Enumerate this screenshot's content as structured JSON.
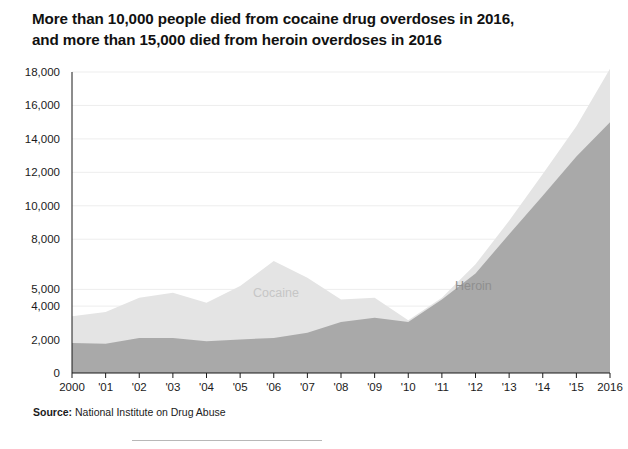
{
  "title": {
    "line1": "More than 10,000 people died from cocaine drug overdoses in 2016,",
    "line2": "and more than 15,000 died from heroin overdoses in 2016"
  },
  "source": {
    "label": "Source:",
    "text": " National Institute on Drug Abuse"
  },
  "colors": {
    "heroin_fill": "#a9a9a9",
    "cocaine_fill": "#e4e4e4",
    "axis": "#1b1b1b",
    "grid": "#ededed",
    "background": "#ffffff"
  },
  "chart_data": {
    "type": "area",
    "stacked": true,
    "title": "More than 10,000 people died from cocaine drug overdoses in 2016, and more than 15,000 died from heroin overdoses in 2016",
    "xlabel": "",
    "ylabel": "",
    "ylim": [
      0,
      18000
    ],
    "grid": true,
    "legend_position": "inline-annotation",
    "x": [
      2000,
      2001,
      2002,
      2003,
      2004,
      2005,
      2006,
      2007,
      2008,
      2009,
      2010,
      2011,
      2012,
      2013,
      2014,
      2015,
      2016
    ],
    "xtick_labels": [
      "2000",
      "'01",
      "'02",
      "'03",
      "'04",
      "'05",
      "'06",
      "'07",
      "'08",
      "'09",
      "'10",
      "'11",
      "'12",
      "'13",
      "'14",
      "'15",
      "2016"
    ],
    "ytick_values": [
      0,
      2000,
      4000,
      5000,
      8000,
      10000,
      12000,
      14000,
      16000,
      18000
    ],
    "ytick_labels": [
      "0",
      "2,000",
      "4,000",
      "5,000",
      "8,000",
      "10,000",
      "12,000",
      "14,000",
      "16,000",
      "18,000"
    ],
    "series": [
      {
        "name": "Heroin",
        "color": "#a9a9a9",
        "values": [
          1800,
          1750,
          2100,
          2100,
          1900,
          2000,
          2100,
          2400,
          3050,
          3300,
          3050,
          4400,
          5950,
          8300,
          10600,
          12950,
          15000
        ]
      },
      {
        "name": "Cocaine",
        "color": "#e4e4e4",
        "values": [
          1600,
          1900,
          2400,
          2700,
          2300,
          3200,
          4600,
          3300,
          1350,
          1200,
          100,
          100,
          550,
          800,
          1300,
          1800,
          3200
        ]
      }
    ],
    "series_totals_stacked": [
      3400,
      3650,
      4500,
      4800,
      4200,
      5200,
      6700,
      5700,
      4400,
      4500,
      3150,
      4500,
      6500,
      9100,
      11900,
      14750,
      18200
    ],
    "annotations": [
      {
        "text": "Cocaine",
        "x": 2005,
        "y": 8200
      },
      {
        "text": "Heroin",
        "x": 2012,
        "y": 8600
      }
    ]
  }
}
